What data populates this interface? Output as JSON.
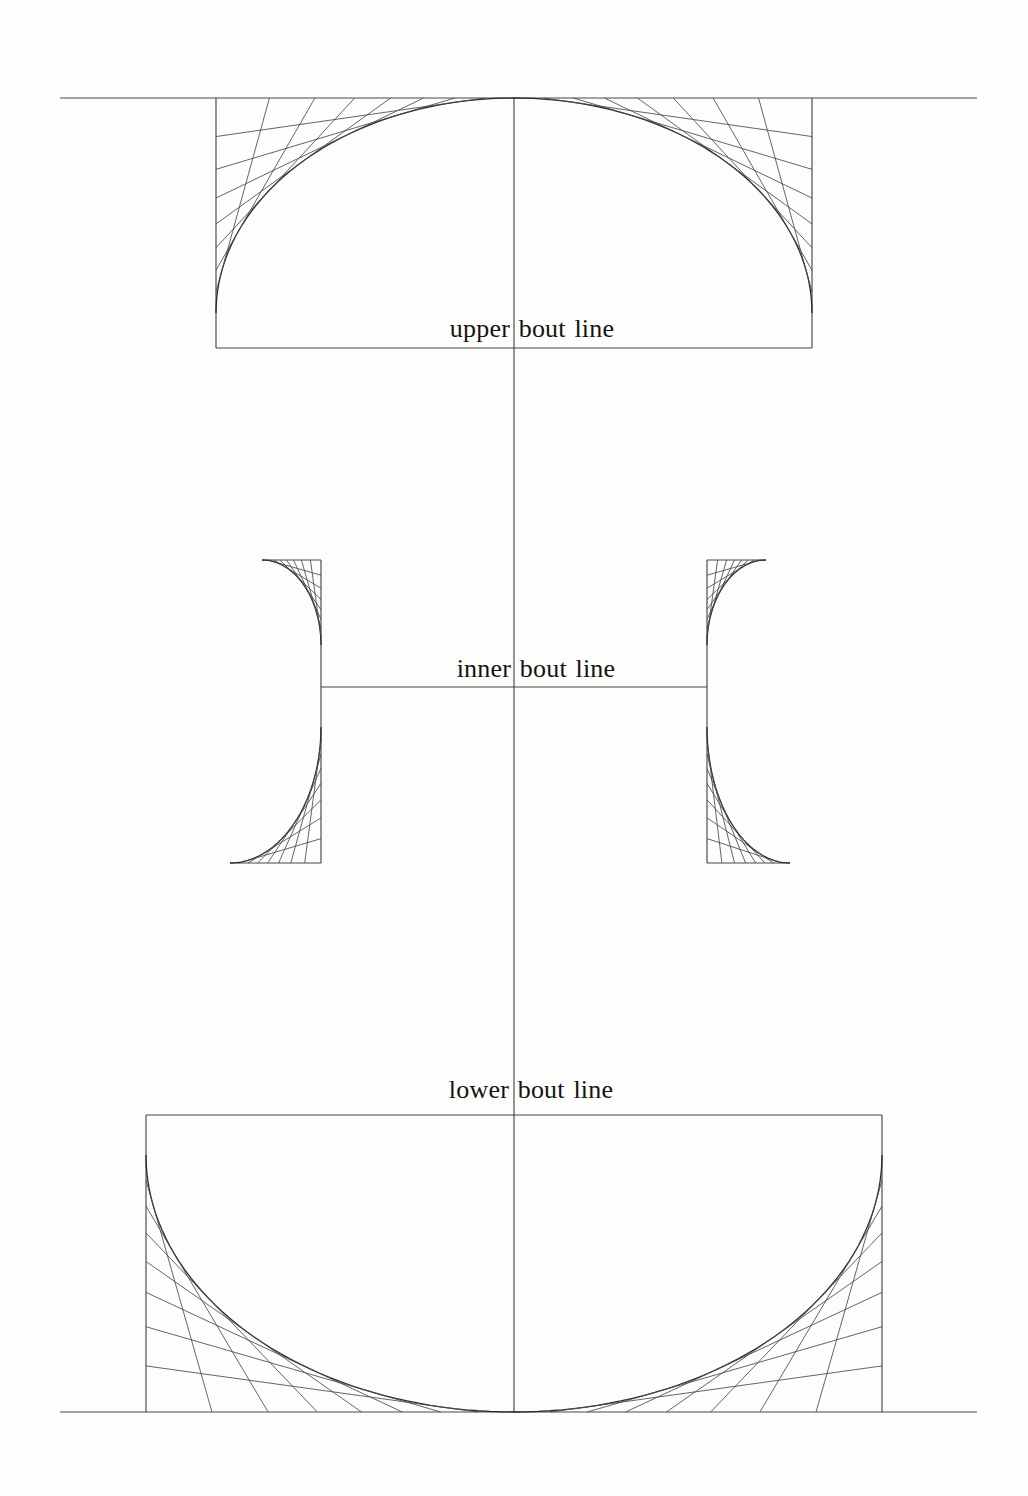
{
  "document": {
    "kind": "scanned geometric construction diagram",
    "paper_color": "#fdfdfb",
    "ink_color": "#2e2e2c"
  },
  "figure": {
    "canvas": {
      "width": 1028,
      "height": 1496
    },
    "center_axis": {
      "name": "center-axis",
      "x": 514,
      "y1": 98,
      "y2": 1412
    },
    "segments": [
      {
        "name": "top-border-line",
        "kind": "frame",
        "x1": 60,
        "y1": 98,
        "x2": 977,
        "y2": 98
      },
      {
        "name": "bottom-border-line",
        "kind": "frame",
        "x1": 60,
        "y1": 1412,
        "x2": 977,
        "y2": 1412
      },
      {
        "name": "center-axis",
        "kind": "frame",
        "x1": 514,
        "y1": 98,
        "x2": 514,
        "y2": 1412
      },
      {
        "name": "upper-bout-line",
        "kind": "frame",
        "x1": 216,
        "y1": 348,
        "x2": 812,
        "y2": 348
      },
      {
        "name": "inner-bout-line",
        "kind": "frame",
        "x1": 321,
        "y1": 687,
        "x2": 707,
        "y2": 687
      },
      {
        "name": "lower-bout-line",
        "kind": "frame",
        "x1": 146,
        "y1": 1115,
        "x2": 882,
        "y2": 1115
      },
      {
        "name": "upper-rect-left-edge",
        "kind": "frame",
        "x1": 216,
        "y1": 98,
        "x2": 216,
        "y2": 348
      },
      {
        "name": "upper-rect-right-edge",
        "kind": "frame",
        "x1": 812,
        "y1": 98,
        "x2": 812,
        "y2": 348
      },
      {
        "name": "cbout-left-edge",
        "kind": "frame",
        "x1": 321,
        "y1": 560,
        "x2": 321,
        "y2": 863
      },
      {
        "name": "cbout-right-edge",
        "kind": "frame",
        "x1": 707,
        "y1": 560,
        "x2": 707,
        "y2": 863
      },
      {
        "name": "cbout-left-top-tick",
        "kind": "frame",
        "x1": 262,
        "y1": 560,
        "x2": 321,
        "y2": 560
      },
      {
        "name": "cbout-right-top-tick",
        "kind": "frame",
        "x1": 707,
        "y1": 560,
        "x2": 766,
        "y2": 560
      },
      {
        "name": "cbout-left-bottom-tick",
        "kind": "frame",
        "x1": 230,
        "y1": 863,
        "x2": 321,
        "y2": 863
      },
      {
        "name": "cbout-right-bottom-tick",
        "kind": "frame",
        "x1": 707,
        "y1": 863,
        "x2": 790,
        "y2": 863
      },
      {
        "name": "lower-rect-left-edge",
        "kind": "frame",
        "x1": 146,
        "y1": 1115,
        "x2": 146,
        "y2": 1412
      },
      {
        "name": "lower-rect-right-edge",
        "kind": "frame",
        "x1": 882,
        "y1": 1115,
        "x2": 882,
        "y2": 1412
      }
    ],
    "quadrants": [
      {
        "name": "upper-bout-left-envelope",
        "corner": [
          216,
          98
        ],
        "h": [
          514,
          98
        ],
        "v": [
          216,
          313
        ]
      },
      {
        "name": "upper-bout-right-envelope",
        "corner": [
          812,
          98
        ],
        "h": [
          514,
          98
        ],
        "v": [
          812,
          313
        ]
      },
      {
        "name": "cbout-left-top-envelope",
        "corner": [
          321,
          560
        ],
        "h": [
          262,
          560
        ],
        "v": [
          321,
          645
        ]
      },
      {
        "name": "cbout-right-top-envelope",
        "corner": [
          707,
          560
        ],
        "h": [
          766,
          560
        ],
        "v": [
          707,
          645
        ]
      },
      {
        "name": "cbout-left-bottom-envelope",
        "corner": [
          321,
          863
        ],
        "h": [
          230,
          863
        ],
        "v": [
          321,
          727
        ]
      },
      {
        "name": "cbout-right-bottom-envelope",
        "corner": [
          707,
          863
        ],
        "h": [
          790,
          863
        ],
        "v": [
          707,
          727
        ]
      },
      {
        "name": "lower-bout-left-envelope",
        "corner": [
          146,
          1412
        ],
        "h": [
          514,
          1412
        ],
        "v": [
          146,
          1155
        ]
      },
      {
        "name": "lower-bout-right-envelope",
        "corner": [
          882,
          1412
        ],
        "h": [
          514,
          1412
        ],
        "v": [
          882,
          1155
        ]
      }
    ],
    "tangents_per_quadrant": 7,
    "labels": [
      {
        "id": "upper-bout-label",
        "text": "upper bout line",
        "x": 532,
        "y": 337
      },
      {
        "id": "inner-bout-label",
        "text": "inner bout line",
        "x": 536,
        "y": 677
      },
      {
        "id": "lower-bout-label",
        "text": "lower bout line",
        "x": 531,
        "y": 1098
      }
    ]
  }
}
